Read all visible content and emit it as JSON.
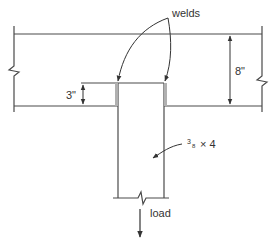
{
  "diagram": {
    "labels": {
      "welds": "welds",
      "beam_depth": "8\"",
      "weld_length": "3\"",
      "plate_size_num": "3",
      "plate_size_den": "8",
      "plate_size_rest": "× 4",
      "load": "load"
    },
    "colors": {
      "line": "#4a4a4a",
      "weld": "#b0b0b0",
      "text": "#333333"
    }
  }
}
